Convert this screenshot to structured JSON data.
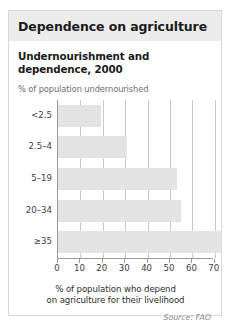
{
  "header": {
    "title": "Dependence on agriculture"
  },
  "chart_data": {
    "type": "bar",
    "orientation": "horizontal",
    "title": "Undernourishment and dependence, 2000",
    "ylabel": "% of population undernourished",
    "xlabel": "% of population who depend\non agriculture for their livelihood",
    "xlabel_line1": "% of population who depend",
    "xlabel_line2": "on agriculture for their livelihood",
    "categories": [
      "<2.5",
      "2.5–4",
      "5–19",
      "20–34",
      "≥35"
    ],
    "values": [
      19,
      31,
      53,
      55,
      73
    ],
    "xlim": [
      0,
      75
    ],
    "xticks": [
      0,
      10,
      20,
      30,
      40,
      50,
      60,
      70
    ],
    "xticklabels": [
      "0",
      "10",
      "20",
      "30",
      "40",
      "50",
      "60",
      "70"
    ],
    "grid": true,
    "legend": false,
    "bar_color": "#e3e3e3",
    "source": "Source: FAO"
  }
}
